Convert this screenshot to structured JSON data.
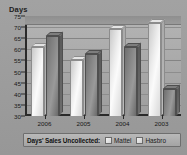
{
  "chart_data": {
    "type": "bar",
    "title": "",
    "ylabel": "Days",
    "xlabel": "",
    "ylim": [
      30,
      75
    ],
    "yticks": [
      30,
      35,
      40,
      45,
      50,
      55,
      60,
      65,
      70,
      75
    ],
    "grid": true,
    "legend_position": "bottom",
    "legend_title": "Days' Sales Uncollected:",
    "categories": [
      "2006",
      "2005",
      "2004",
      "2003"
    ],
    "series": [
      {
        "name": "Mattel",
        "values": [
          61,
          55,
          69,
          72
        ]
      },
      {
        "name": "Hasbro",
        "values": [
          66,
          58,
          61,
          42
        ]
      }
    ]
  },
  "axis": {
    "y_title": "Days"
  },
  "legend": {
    "title": "Days' Sales Uncollected:",
    "entries": [
      {
        "label": "Mattel",
        "key": "mattel"
      },
      {
        "label": "Hasbro",
        "key": "hasbro"
      }
    ]
  }
}
